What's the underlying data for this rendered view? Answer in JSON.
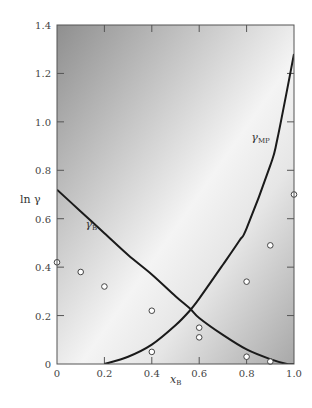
{
  "chart_data": {
    "type": "line",
    "title": "",
    "xlabel": "x",
    "xlabel_sub": "B",
    "ylabel": "ln γ",
    "xlim": [
      0,
      1.0
    ],
    "ylim": [
      0,
      1.4
    ],
    "xticks": [
      "0",
      "0.2",
      "0.4",
      "0.6",
      "0.8",
      "1.0"
    ],
    "xtick_values": [
      0,
      0.2,
      0.4,
      0.6,
      0.8,
      1.0
    ],
    "yticks": [
      "0",
      "0.2",
      "0.4",
      "0.6",
      "0.8",
      "1.0",
      "1.2",
      "1.4"
    ],
    "ytick_values": [
      0,
      0.2,
      0.4,
      0.6,
      0.8,
      1.0,
      1.2,
      1.4
    ],
    "grid": false,
    "series": [
      {
        "name": "γB",
        "label_main": "γ",
        "label_sub": "B",
        "label_at": [
          0.12,
          0.56
        ],
        "x": [
          0,
          0.1,
          0.2,
          0.3,
          0.4,
          0.5,
          0.56,
          0.6,
          0.7,
          0.8,
          0.9,
          0.97,
          1.0
        ],
        "y": [
          0.72,
          0.63,
          0.54,
          0.45,
          0.37,
          0.28,
          0.23,
          0.19,
          0.12,
          0.06,
          0.02,
          0.0,
          0.0
        ]
      },
      {
        "name": "γMP",
        "label_main": "γ",
        "label_sub": "MP",
        "label_at": [
          0.82,
          0.92
        ],
        "x": [
          0.2,
          0.3,
          0.4,
          0.5,
          0.56,
          0.6,
          0.7,
          0.77,
          0.8,
          0.9,
          0.93,
          1.0
        ],
        "y": [
          0.0,
          0.03,
          0.08,
          0.16,
          0.22,
          0.27,
          0.41,
          0.51,
          0.56,
          0.82,
          0.93,
          1.28
        ]
      }
    ],
    "scatter": {
      "name": "experimental",
      "points": [
        [
          0.0,
          0.42
        ],
        [
          0.1,
          0.38
        ],
        [
          0.2,
          0.32
        ],
        [
          0.4,
          0.22
        ],
        [
          0.4,
          0.05
        ],
        [
          0.6,
          0.15
        ],
        [
          0.6,
          0.11
        ],
        [
          0.8,
          0.34
        ],
        [
          0.8,
          0.03
        ],
        [
          0.9,
          0.49
        ],
        [
          0.9,
          0.01
        ],
        [
          1.0,
          0.7
        ]
      ]
    }
  }
}
